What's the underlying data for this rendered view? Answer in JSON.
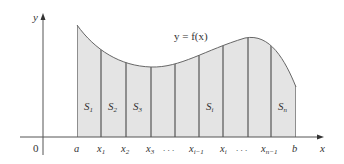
{
  "figure": {
    "type": "area-under-curve-partition",
    "axis_labels": {
      "x": "x",
      "y": "y"
    },
    "origin_label": "0",
    "curve_label": "y = f(x)",
    "tick_labels": [
      "a",
      "x1",
      "x2",
      "x3",
      "...",
      "xi-1",
      "xi",
      "...",
      "xn-1",
      "b"
    ],
    "strip_labels": [
      "S1",
      "S2",
      "S3",
      "Si",
      "Sn"
    ],
    "colors": {
      "fill": "#e4e4e4",
      "stroke": "#555555",
      "axis": "#555555"
    }
  }
}
